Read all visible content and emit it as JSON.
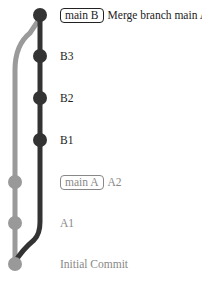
{
  "colors": {
    "branch_b": "#333333",
    "branch_a": "#999999"
  },
  "commits": [
    {
      "id": "merge",
      "branch": "B",
      "tag": "main B",
      "message": "Merge branch main A"
    },
    {
      "id": "b3",
      "branch": "B",
      "tag": null,
      "message": "B3"
    },
    {
      "id": "b2",
      "branch": "B",
      "tag": null,
      "message": "B2"
    },
    {
      "id": "b1",
      "branch": "B",
      "tag": null,
      "message": "B1"
    },
    {
      "id": "a2",
      "branch": "A",
      "tag": "main A",
      "message": "A2"
    },
    {
      "id": "a1",
      "branch": "A",
      "tag": null,
      "message": "A1"
    },
    {
      "id": "init",
      "branch": "A",
      "tag": null,
      "message": "Initial Commit"
    }
  ]
}
